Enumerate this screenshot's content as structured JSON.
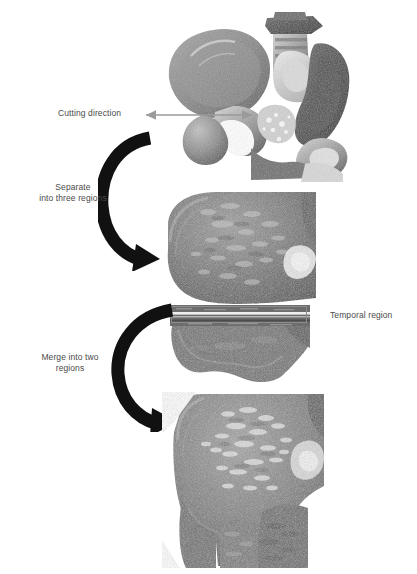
{
  "figure": {
    "title_text": "",
    "background": "#ffffff",
    "text_color": "#4a4a4a",
    "arrow_color": "#111111",
    "box_color": "#8d8d8d"
  },
  "labels": {
    "cutting_direction": "Cutting direction",
    "separate_regions": "Separate\ninto three regions",
    "merge_regions": "Merge into two\nregions",
    "temporal_region": "Temporal region"
  },
  "panels": [
    {
      "id": "panel-pelvis-overview",
      "name": "pelvis-3d-render",
      "caption": "",
      "x": 155,
      "y": 8,
      "w": 200,
      "h": 173
    },
    {
      "id": "panel-separated",
      "name": "femoral-head-separated-render",
      "caption": "",
      "x": 160,
      "y": 190,
      "w": 155,
      "h": 150
    },
    {
      "id": "panel-merged",
      "name": "femoral-head-merged-render",
      "caption": "",
      "x": 162,
      "y": 392,
      "w": 160,
      "h": 175
    }
  ],
  "annotations": {
    "cutting_arrow": {
      "x1": 250,
      "y1": 114,
      "x2": 143,
      "y2": 114,
      "direction": "left"
    },
    "temporal_box": {
      "x": 171,
      "y": 306,
      "w": 135,
      "h": 17
    },
    "curved_arrow_1": {
      "cx": 138,
      "cy": 192,
      "r": 55
    },
    "curved_arrow_2": {
      "cx": 150,
      "cy": 368,
      "r": 55
    }
  }
}
